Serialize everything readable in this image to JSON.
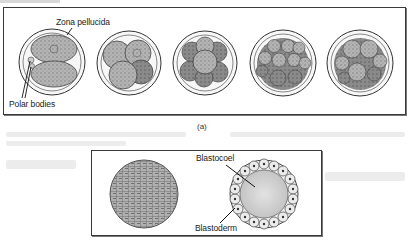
{
  "figure": {
    "panel_a": {
      "caption": "(a)",
      "stages": [
        {
          "name": "2-cell stage",
          "cells": 2
        },
        {
          "name": "4-cell stage",
          "cells": 4
        },
        {
          "name": "8-cell stage",
          "cells": 8
        },
        {
          "name": "16-cell stage",
          "cells": 16
        },
        {
          "name": "morula",
          "cells": 16
        }
      ],
      "labels": {
        "zona_pellucida": "Zona pellucida",
        "polar_bodies": "Polar bodies"
      }
    },
    "panel_b": {
      "labels": {
        "blastocoel": "Blastocoel",
        "blastoderm": "Blastoderm"
      }
    }
  },
  "colors": {
    "background": "#ffffff",
    "border": "#3a3a3a",
    "cell_fill": "#a8a8a8",
    "cell_dark": "#6e6e6e",
    "zona": "#f4f4f4"
  }
}
